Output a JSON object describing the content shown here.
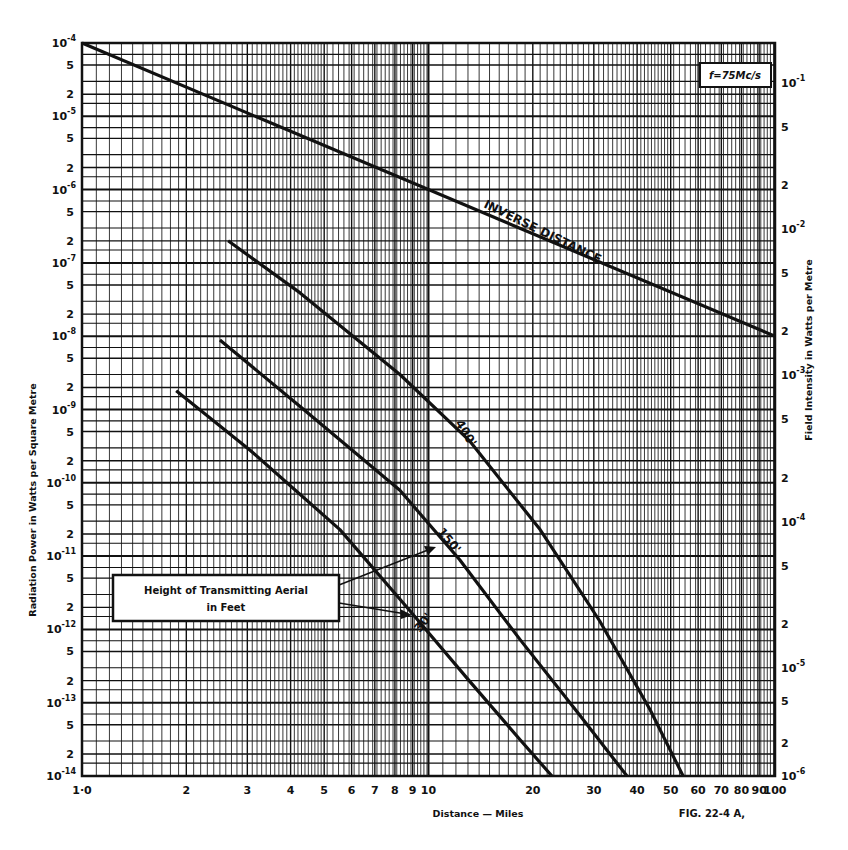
{
  "header": {
    "top_left_fragment": "22.5",
    "top_mid_fragment": "(a)"
  },
  "figure_label": "FIG. 22-4 A,",
  "frequency_label": "f=75Mc/s",
  "annotation_box": {
    "line1": "Height of Transmitting Aerial",
    "line2": "in Feet"
  },
  "chart_data": {
    "type": "line",
    "title": "",
    "xlabel": "Distance — Miles",
    "ylabel": "Radiation Power in Watts per Square Metre",
    "y2label": "Field Intensity in Watts per Metre",
    "xscale": "log",
    "yscale": "log",
    "xlim": [
      1,
      100
    ],
    "ylim": [
      1e-14,
      0.0001
    ],
    "grid": true,
    "x_tick_labels": [
      "1·0",
      "2",
      "3",
      "4",
      "5",
      "6",
      "7",
      "8",
      "9",
      "10",
      "20",
      "30",
      "40",
      "50",
      "60",
      "70",
      "80",
      "90",
      "100"
    ],
    "x_tick_values": [
      1,
      2,
      3,
      4,
      5,
      6,
      7,
      8,
      9,
      10,
      20,
      30,
      40,
      50,
      60,
      70,
      80,
      90,
      100
    ],
    "y_decade_labels": [
      "10^-4",
      "10^-5",
      "10^-6",
      "10^-7",
      "10^-8",
      "10^-9",
      "10^-10",
      "10^-11",
      "10^-12",
      "10^-13",
      "10^-14"
    ],
    "y_minor_labels": [
      "5",
      "2"
    ],
    "y2_decade_labels": [
      "10^-1",
      "10^-2",
      "10^-3",
      "10^-4",
      "10^-5",
      "10^-6"
    ],
    "y2_minor_labels": [
      "5",
      "2"
    ],
    "frequency": "f=75Mc/s",
    "series": [
      {
        "name": "INVERSE DISTANCE",
        "x": [
          1,
          100
        ],
        "y": [
          0.0001,
          1e-08
        ]
      },
      {
        "name": "400'",
        "x": [
          2.64,
          4.26,
          8.27,
          13.1,
          21.0,
          31.2,
          43.6,
          54.3
        ],
        "y": [
          2e-07,
          3.9e-08,
          3e-09,
          3.8e-10,
          2.3e-11,
          1.3e-12,
          8e-14,
          1e-14
        ]
      },
      {
        "name": "150'",
        "x": [
          2.5,
          4.26,
          8.27,
          12.3,
          18.4,
          27.3,
          37.4
        ],
        "y": [
          8.9e-09,
          1.1e-09,
          7.9e-11,
          8.9e-12,
          7.2e-13,
          6.8e-14,
          1e-14
        ]
      },
      {
        "name": "30'",
        "x": [
          1.87,
          3.05,
          5.55,
          8.84,
          13.1,
          18.4,
          22.7
        ],
        "y": [
          1.8e-09,
          2.8e-10,
          2.3e-11,
          1.8e-12,
          2e-13,
          3.1e-14,
          1e-14
        ]
      }
    ],
    "annotations": [
      "INVERSE DISTANCE",
      "400'",
      "150'",
      "30'",
      "Height of Transmitting Aerial in Feet",
      "f=75Mc/s",
      "FIG. 22-4 A,"
    ]
  }
}
